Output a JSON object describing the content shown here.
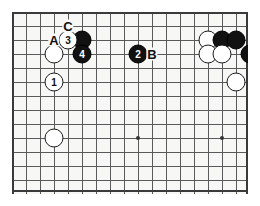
{
  "diagram": {
    "type": "go-board-diagram",
    "board_size_cols": 18,
    "board_size_rows": 14,
    "grid_spacing_px": 14,
    "board_origin": {
      "x": 14,
      "y": 14
    },
    "colors": {
      "board_background": "#f7f7f5",
      "grid_line": "#5a5a5a",
      "border_line": "#3a3a3a",
      "black_stone": "#111111",
      "white_stone": "#ffffff",
      "stone_outline": "#1a1a1a",
      "star_point": "#333333",
      "page_background": "#ffffff"
    },
    "star_points": [
      {
        "col": 2,
        "row": 8
      },
      {
        "col": 8,
        "row": 8
      },
      {
        "col": 14,
        "row": 8
      }
    ],
    "stones": [
      {
        "col": 4,
        "row": 1,
        "color": "black",
        "number": ""
      },
      {
        "col": 3,
        "row": 1,
        "color": "white",
        "number": "3"
      },
      {
        "col": 4,
        "row": 2,
        "color": "black",
        "number": "4"
      },
      {
        "col": 2,
        "row": 2,
        "color": "white",
        "number": ""
      },
      {
        "col": 2,
        "row": 4,
        "color": "white",
        "number": "1"
      },
      {
        "col": 8,
        "row": 2,
        "color": "black",
        "number": "2"
      },
      {
        "col": 2,
        "row": 8,
        "color": "white",
        "number": ""
      },
      {
        "col": 13,
        "row": 1,
        "color": "white",
        "number": ""
      },
      {
        "col": 14,
        "row": 1,
        "color": "black",
        "number": ""
      },
      {
        "col": 15,
        "row": 1,
        "color": "black",
        "number": ""
      },
      {
        "col": 13,
        "row": 2,
        "color": "white",
        "number": ""
      },
      {
        "col": 14,
        "row": 2,
        "color": "white",
        "number": ""
      },
      {
        "col": 16,
        "row": 2,
        "color": "black",
        "number": ""
      },
      {
        "col": 17,
        "row": 2,
        "color": "black",
        "number": ""
      },
      {
        "col": 17,
        "row": 3,
        "color": "white",
        "number": ""
      },
      {
        "col": 15,
        "row": 4,
        "color": "white",
        "number": ""
      }
    ],
    "labels": [
      {
        "text": "C",
        "col": 3,
        "row": 0
      },
      {
        "text": "A",
        "col": 2,
        "row": 1
      },
      {
        "text": "B",
        "col": 9,
        "row": 2
      }
    ]
  }
}
